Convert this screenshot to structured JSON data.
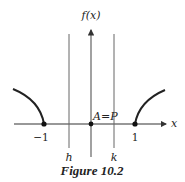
{
  "figure": {
    "caption": "Figure 10.2",
    "y_axis_label": "f(x)",
    "x_axis_label": "x",
    "tick_labels": {
      "neg_one": "−1",
      "one": "1"
    },
    "vertical_line_labels": {
      "left": "h",
      "right": "k"
    },
    "point_annotation": "A=P",
    "colors": {
      "axis": "#333333",
      "curve": "#222222",
      "guide_lines": "#666666"
    }
  }
}
